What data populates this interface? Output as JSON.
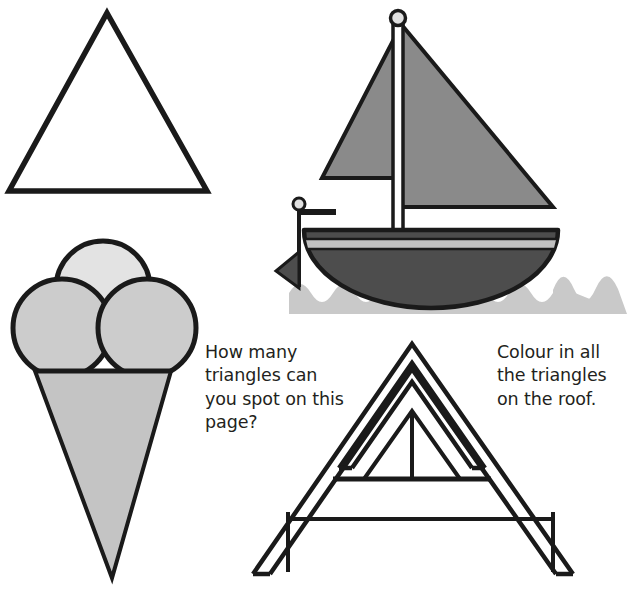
{
  "page": {
    "background_color": "#ffffff",
    "width": 627,
    "height": 591
  },
  "prompts": {
    "count_question": "How many triangles can you spot on this page?",
    "colour_instruction": "Colour in all the triangles on the roof."
  },
  "illustrations": {
    "plain_triangle": {
      "name": "plain-triangle",
      "fill": "#ffffff",
      "stroke": "#1a1a1a",
      "stroke_width": 5
    },
    "ice_cream_cone": {
      "name": "ice-cream-cone",
      "top_scoop_fill": "#e3e3e3",
      "side_scoop_fill": "#cccccc",
      "cone_fill": "#c4c4c4",
      "stroke": "#1a1a1a",
      "scoop_count": 3
    },
    "sailboat": {
      "name": "sailboat",
      "sail_fill": "#8a8a8a",
      "hull_fill": "#4d4d4d",
      "hull_stripe_fill": "#c0c0c0",
      "water_fill": "#c9c9c9",
      "mast_fill": "#ffffff",
      "flag_fill": "#4d4d4d",
      "stroke": "#1a1a1a",
      "sail_count": 2
    },
    "house_roof": {
      "name": "house-roof",
      "fill": "#ffffff",
      "stroke": "#1a1a1a",
      "stroke_width": 4,
      "triangle_layers": 3,
      "has_window_divider": true
    }
  },
  "colors": {
    "ink": "#1a1a1a",
    "text": "#231f20",
    "paper": "#ffffff"
  }
}
